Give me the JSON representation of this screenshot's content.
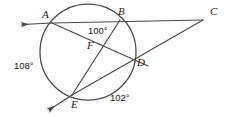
{
  "figure": {
    "type": "circle-geometry-diagram",
    "stroke_color": "#4a4a4a",
    "text_color": "#1b1b1b",
    "background_color": "#ffffff"
  },
  "points": {
    "A": {
      "label": "A",
      "x": 52,
      "y": 23,
      "label_x": 42,
      "label_y": 9
    },
    "B": {
      "label": "B",
      "x": 120,
      "y": 20,
      "label_x": 118,
      "label_y": 6
    },
    "C": {
      "label": "C",
      "x": 203,
      "y": 20,
      "label_x": 210,
      "label_y": 6
    },
    "D": {
      "label": "D",
      "x": 133,
      "y": 60,
      "label_x": 137,
      "label_y": 57
    },
    "E": {
      "label": "E",
      "x": 72,
      "y": 95,
      "label_x": 71,
      "label_y": 99
    },
    "F": {
      "label": "F",
      "x": 100,
      "y": 44,
      "label_x": 87,
      "label_y": 40
    }
  },
  "arcs": [
    {
      "name": "arc-AE-measure",
      "label": "108°",
      "x": 14,
      "y": 61
    },
    {
      "name": "arc-DE-measure",
      "label": "102°",
      "x": 110,
      "y": 93
    }
  ],
  "angles": [
    {
      "name": "angle-at-F",
      "label": "100°",
      "x": 88,
      "y": 26
    }
  ],
  "segments": [
    {
      "name": "ray-from-A-left",
      "from": "A",
      "to": "arrow-left"
    },
    {
      "name": "secant-A-B-C",
      "from": "A",
      "to": "C"
    },
    {
      "name": "chord-A-D",
      "from": "A",
      "to": "D"
    },
    {
      "name": "chord-B-E",
      "from": "B",
      "to": "E"
    },
    {
      "name": "secant-E-D-C",
      "from": "E",
      "to": "C"
    },
    {
      "name": "ray-from-E-down-left",
      "from": "E",
      "to": "arrow-down-left"
    }
  ],
  "circle": {
    "cx": 88,
    "cy": 52,
    "r": 48
  }
}
